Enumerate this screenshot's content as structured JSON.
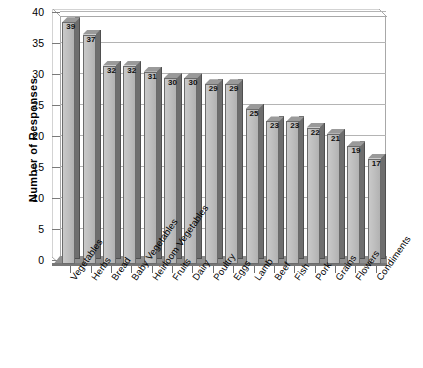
{
  "chart_data": {
    "type": "bar",
    "title": "",
    "subtitle": "",
    "xlabel": "",
    "ylabel": "Number of Responses",
    "ylim": [
      0,
      40
    ],
    "ytick_step": 5,
    "yticks": [
      0,
      5,
      10,
      15,
      20,
      25,
      30,
      35,
      40
    ],
    "grid": true,
    "legend": false,
    "legend_position": "none",
    "data_labels": true,
    "style": "3d-column",
    "categories": [
      "Vegetables",
      "Herbs",
      "Bread",
      "Baby Vegetables",
      "Heirloom Vegetables",
      "Fruits",
      "Dairy",
      "Poultry",
      "Eggs",
      "Lamb",
      "Beef",
      "Fish",
      "Pork",
      "Grains",
      "Flowers",
      "Condiments"
    ],
    "values": [
      39,
      37,
      32,
      32,
      31,
      30,
      30,
      29,
      29,
      25,
      23,
      23,
      22,
      21,
      19,
      17
    ]
  },
  "colors": {
    "background": "#ffffff",
    "plot_background": "#ffffff",
    "bar_face": "#c0c0c0",
    "bar_side": "#6e6e6e",
    "bar_top": "#9a9a9a",
    "bar_outline": "#6b6b6b",
    "gridline": "#b4b4b4",
    "axis": "#7a7a7a",
    "text": "#000000"
  }
}
